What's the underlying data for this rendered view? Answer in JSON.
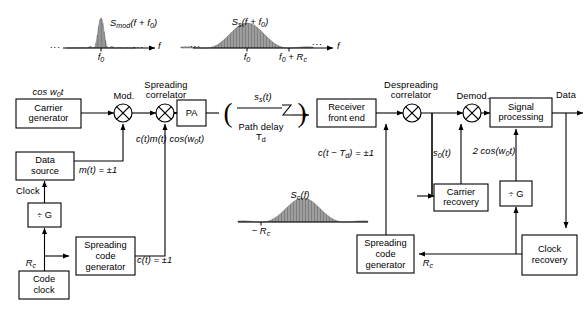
{
  "figure": {
    "type": "block-diagram",
    "background": "#ffffff",
    "line_color": "#000000",
    "spectrum_fill": "#bdbdbd"
  },
  "spectra": {
    "mod": {
      "label": "S",
      "label_sub": "mod",
      "label_rest": "(f + f",
      "label_sub2": "0",
      "label_end": ")",
      "axis_label": "f",
      "tick0": "f",
      "tick0_sub": "0",
      "shape": "narrow sinc-squared centered at f0",
      "ellipsis_left": "...",
      "ellipsis_right": "..."
    },
    "s": {
      "label": "S",
      "label_sub": "s",
      "label_rest": "(f + f",
      "label_sub2": "0",
      "label_end": ")",
      "axis_label": "f",
      "tick0": "f",
      "tick0_sub": "0",
      "tick1": "f",
      "tick1_sub": "0",
      "tick1_rest": " + R",
      "tick1_sub2": "c",
      "shape": "wide sinc-squared centered at f0, first null at f0 + Rc",
      "ellipsis_left": "...",
      "ellipsis_right": "..."
    },
    "c": {
      "label": "S",
      "label_sub": "c",
      "label_rest": "(f)",
      "tick0": "− R",
      "tick0_sub": "c",
      "shape": "wide sinc-squared baseband, nulls at −Rc and +Rc"
    }
  },
  "blocks": [
    {
      "id": "carrier-generator",
      "line1": "Carrier",
      "line2": "generator"
    },
    {
      "id": "data-source",
      "line1": "Data",
      "line2": "source"
    },
    {
      "id": "divide-g-tx",
      "line1": "÷ G",
      "line2": ""
    },
    {
      "id": "code-clock",
      "line1": "Code",
      "line2": "clock"
    },
    {
      "id": "spreading-code-generator-tx",
      "line1": "Spreading",
      "line2": "code",
      "line3": "generator"
    },
    {
      "id": "pa",
      "line1": "PA",
      "line2": ""
    },
    {
      "id": "receiver-front-end",
      "line1": "Receiver",
      "line2": "front end"
    },
    {
      "id": "signal-processing",
      "line1": "Signal",
      "line2": "processing"
    },
    {
      "id": "carrier-recovery",
      "line1": "Carrier",
      "line2": "recovery"
    },
    {
      "id": "divide-g-rx",
      "line1": "÷ G",
      "line2": ""
    },
    {
      "id": "clock-recovery",
      "line1": "Clock",
      "line2": "recovery"
    },
    {
      "id": "spreading-code-generator-rx",
      "line1": "Spreading",
      "line2": "code",
      "line3": "generator"
    }
  ],
  "mixers": [
    {
      "id": "modulator",
      "caption": "Mod."
    },
    {
      "id": "spreading-correlator",
      "caption_l1": "Spreading",
      "caption_l2": "correlator"
    },
    {
      "id": "despreading-correlator",
      "caption_l1": "Despreading",
      "caption_l2": "correlator"
    },
    {
      "id": "demodulator",
      "caption": "Demod."
    }
  ],
  "signal_labels": {
    "cos_w0t": "cos w",
    "cos_w0t_sub": "0",
    "cos_w0t_end": "t",
    "mt": "m(t)  =  ±1",
    "ct": "c(t)  =  ±1",
    "clock": "Clock",
    "rc_tx": "R",
    "rc_tx_sub": "c",
    "ctmt": "c(t)m(t) cos(w",
    "ctmt_sub": "0",
    "ctmt_end": "t)",
    "sst": "s",
    "sst_sub": "s",
    "sst_end": "(t)",
    "path_delay_l1": "Path delay",
    "path_delay_l2": "T",
    "path_delay_l2_sub": "d",
    "ct_td": "c(t − T",
    "ct_td_sub": "d",
    "ct_td_end": ")  =  ±1",
    "s0t": "s",
    "s0t_sub": "0",
    "s0t_end": "(t)",
    "two_cos": "2 cos(w",
    "two_cos_sub": "0",
    "two_cos_end": "t)",
    "data_out": "Data",
    "rc_rx": "R",
    "rc_rx_sub": "c"
  }
}
